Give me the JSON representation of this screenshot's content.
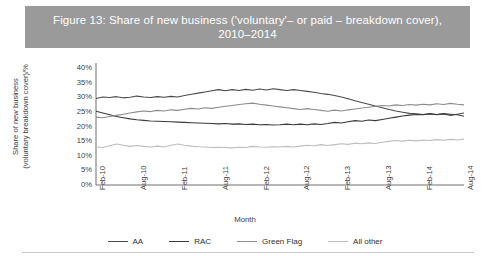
{
  "figure": {
    "title": "Figure 13: Share of new business ('voluntary'– or paid – breakdown cover), 2010–2014",
    "banner_color": "#9a9a9a",
    "banner_text_color": "#ffffff"
  },
  "axes": {
    "y_label": "Share of new business\n(voluntary breakdown cover)/%",
    "x_label": "Month",
    "y_ticks": [
      "0%",
      "5%",
      "10%",
      "15%",
      "20%",
      "25%",
      "30%",
      "35%",
      "40%"
    ],
    "x_ticks": [
      "Feb-10",
      "Aug-10",
      "Feb-11",
      "Aug-11",
      "Feb-12",
      "Aug-12",
      "Feb-13",
      "Aug-13",
      "Feb-14",
      "Aug-14"
    ]
  },
  "legend": {
    "position": "bottom",
    "items": [
      {
        "label": "AA",
        "color": "#4a4a4a"
      },
      {
        "label": "RAC",
        "color": "#3a3a3a"
      },
      {
        "label": "Green Flag",
        "color": "#8c8c8c"
      },
      {
        "label": "All other",
        "color": "#bdbdbd"
      }
    ]
  },
  "chart_data": {
    "type": "line",
    "title": "Figure 13: Share of new business ('voluntary'– or paid – breakdown cover), 2010–2014",
    "xlabel": "Month",
    "ylabel": "Share of new business (voluntary breakdown cover)/%",
    "ylim": [
      0,
      40
    ],
    "yticks": [
      0,
      5,
      10,
      15,
      20,
      25,
      30,
      35,
      40
    ],
    "grid": false,
    "legend_position": "bottom",
    "x": [
      "Feb-10",
      "Mar-10",
      "Apr-10",
      "May-10",
      "Jun-10",
      "Jul-10",
      "Aug-10",
      "Sep-10",
      "Oct-10",
      "Nov-10",
      "Dec-10",
      "Jan-11",
      "Feb-11",
      "Mar-11",
      "Apr-11",
      "May-11",
      "Jun-11",
      "Jul-11",
      "Aug-11",
      "Sep-11",
      "Oct-11",
      "Nov-11",
      "Dec-11",
      "Jan-12",
      "Feb-12",
      "Mar-12",
      "Apr-12",
      "May-12",
      "Jun-12",
      "Jul-12",
      "Aug-12",
      "Sep-12",
      "Oct-12",
      "Nov-12",
      "Dec-12",
      "Jan-13",
      "Feb-13",
      "Mar-13",
      "Apr-13",
      "May-13",
      "Jun-13",
      "Jul-13",
      "Aug-13",
      "Sep-13",
      "Oct-13",
      "Nov-13",
      "Dec-13",
      "Jan-14",
      "Feb-14",
      "Mar-14",
      "Apr-14",
      "May-14",
      "Jun-14",
      "Jul-14",
      "Aug-14"
    ],
    "x_tick_labels": [
      "Feb-10",
      "Aug-10",
      "Feb-11",
      "Aug-11",
      "Feb-12",
      "Aug-12",
      "Feb-13",
      "Aug-13",
      "Feb-14",
      "Aug-14"
    ],
    "series": [
      {
        "name": "AA",
        "color": "#4a4a4a",
        "values": [
          29.6,
          30.1,
          29.9,
          30.2,
          29.8,
          30.0,
          30.4,
          30.1,
          29.9,
          30.2,
          30.0,
          30.3,
          30.1,
          30.6,
          31.0,
          31.4,
          31.8,
          32.2,
          32.6,
          32.2,
          32.6,
          32.3,
          32.7,
          32.4,
          32.8,
          32.5,
          32.9,
          32.6,
          32.3,
          32.6,
          32.3,
          32.0,
          31.7,
          31.3,
          31.0,
          30.6,
          30.1,
          29.5,
          28.8,
          28.2,
          27.6,
          27.0,
          26.4,
          25.8,
          25.3,
          24.9,
          24.5,
          24.3,
          24.1,
          24.4,
          24.0,
          24.3,
          23.8,
          24.2,
          24.6
        ]
      },
      {
        "name": "RAC",
        "color": "#3a3a3a",
        "values": [
          25.2,
          24.6,
          24.0,
          23.4,
          23.0,
          22.6,
          22.3,
          22.1,
          21.9,
          21.8,
          21.7,
          21.6,
          21.5,
          21.4,
          21.3,
          21.2,
          21.1,
          21.0,
          20.9,
          21.0,
          20.8,
          20.9,
          20.7,
          20.8,
          20.6,
          20.7,
          20.5,
          20.6,
          20.8,
          20.6,
          20.8,
          20.6,
          20.9,
          20.7,
          21.0,
          21.4,
          21.2,
          21.6,
          22.0,
          21.8,
          22.2,
          22.0,
          22.4,
          22.8,
          23.2,
          23.6,
          23.9,
          24.1,
          24.0,
          24.3,
          24.1,
          24.4,
          24.2,
          24.0,
          23.5
        ]
      },
      {
        "name": "Green Flag",
        "color": "#8c8c8c",
        "values": [
          23.2,
          23.0,
          23.4,
          23.8,
          24.2,
          24.6,
          25.0,
          25.3,
          25.1,
          25.5,
          25.3,
          25.7,
          25.5,
          25.9,
          26.2,
          26.0,
          26.4,
          26.2,
          26.6,
          26.9,
          27.2,
          27.5,
          27.8,
          28.0,
          27.6,
          27.3,
          27.0,
          26.7,
          26.4,
          26.1,
          25.8,
          26.1,
          25.8,
          25.5,
          25.2,
          25.6,
          25.3,
          25.7,
          26.0,
          26.3,
          26.6,
          26.9,
          27.2,
          27.0,
          27.4,
          27.2,
          27.5,
          27.3,
          27.6,
          27.4,
          27.8,
          27.5,
          27.9,
          27.6,
          27.4
        ]
      },
      {
        "name": "All other",
        "color": "#bdbdbd",
        "values": [
          13.0,
          12.8,
          13.4,
          14.0,
          13.6,
          13.2,
          13.5,
          13.2,
          13.0,
          13.3,
          13.0,
          13.6,
          14.0,
          13.6,
          13.3,
          13.1,
          13.0,
          12.8,
          12.9,
          12.8,
          12.7,
          12.9,
          12.8,
          13.2,
          13.0,
          12.9,
          13.1,
          13.0,
          13.2,
          13.0,
          13.3,
          13.6,
          13.4,
          13.8,
          13.5,
          13.8,
          14.1,
          13.9,
          14.3,
          14.1,
          14.4,
          14.2,
          14.6,
          14.9,
          15.2,
          15.0,
          15.3,
          15.1,
          15.4,
          15.2,
          15.5,
          15.3,
          15.6,
          15.4,
          15.7
        ]
      }
    ]
  }
}
